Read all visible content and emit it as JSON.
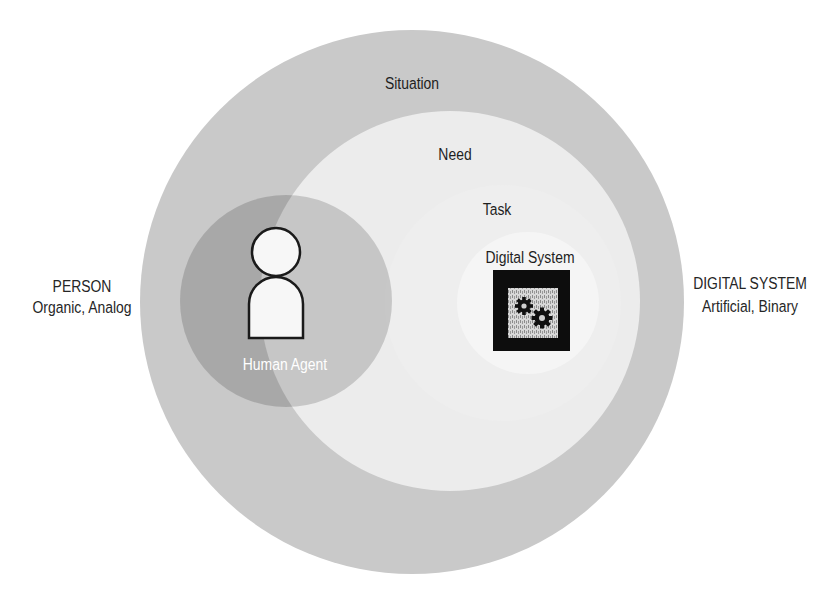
{
  "diagram": {
    "labels": {
      "situation": "Situation",
      "need": "Need",
      "task": "Task",
      "digital_system": "Digital System",
      "human_agent": "Human Agent"
    },
    "side_labels": {
      "left": {
        "heading": "PERSON",
        "subheading": "Organic, Analog"
      },
      "right": {
        "heading": "DIGITAL SYSTEM",
        "subheading": "Artificial, Binary"
      }
    },
    "icons": {
      "human": "person-icon",
      "system": "gears-icon"
    },
    "colors": {
      "background": "#ffffff",
      "situation": "#c9c9c9",
      "need": "#ececec",
      "task": "#eeeeee",
      "digital_system_zone": "#f5f5f5",
      "human_overlay": "#000000",
      "icon_stroke": "#1a1a1a",
      "icon_fill": "#f7f7f7",
      "system_box": "#0d0d0d",
      "system_screen": "#cfcfcf",
      "text": "#1e1e1e",
      "text_inverse": "#ffffff"
    }
  }
}
